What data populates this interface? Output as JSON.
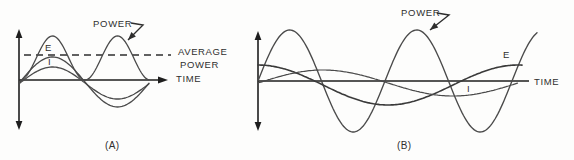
{
  "figure": {
    "colors": {
      "background": "#fdfdfc",
      "axis": "#1e1e1e",
      "curve": "#4a4a4a",
      "curve_dark": "#3a3a3a",
      "dashed": "#2e2e2e",
      "text": "#2f2f2f"
    },
    "panels": [
      {
        "id": "a",
        "caption": "(A)",
        "origin": {
          "x": 20,
          "y": 80
        },
        "vertical_axis": {
          "x": 19,
          "tip_top": 29,
          "tip_bottom": 130,
          "shaft_top": 37,
          "shaft_bottom": 122
        },
        "time_axis": {
          "y": 80,
          "x1": 19,
          "x2": 158,
          "arrow_tip": 168
        },
        "average_line": {
          "y": 55,
          "x1": 24,
          "x2": 171,
          "dash": "7 5"
        },
        "curves": [
          {
            "name": "power-curve",
            "type": "sin2",
            "amplitude": 44,
            "period": 130,
            "offset": 0,
            "t_end": 130,
            "width": 1.3,
            "tone": "curve"
          },
          {
            "name": "voltage-e-curve",
            "type": "sin",
            "amplitude": 25,
            "period": 130,
            "offset": 2,
            "t_end": 130,
            "width": 1.3,
            "tone": "curve"
          },
          {
            "name": "current-i-curve",
            "type": "sin",
            "amplitude": 16,
            "period": 130,
            "offset": 3,
            "t_end": 130,
            "width": 1.3,
            "tone": "curve"
          }
        ],
        "pointer_arrow": {
          "points": [
            [
              131,
              23
            ],
            [
              143,
              25
            ],
            [
              128,
              40
            ]
          ]
        },
        "labels": [
          {
            "name": "power-label",
            "text": "POWER",
            "x": 93,
            "y": 27,
            "size": 9.5,
            "spacing": 0.7
          },
          {
            "name": "e-label",
            "text": "E",
            "x": 45,
            "y": 51,
            "size": 9.5,
            "spacing": 0
          },
          {
            "name": "i-label",
            "text": "I",
            "x": 48,
            "y": 65,
            "size": 9.5,
            "spacing": 0
          },
          {
            "name": "average-power-label-line1",
            "text": "AVERAGE",
            "x": 178,
            "y": 55,
            "size": 9.5,
            "spacing": 0.6
          },
          {
            "name": "average-power-label-line2",
            "text": "POWER",
            "x": 180,
            "y": 68,
            "size": 9.5,
            "spacing": 0.6
          },
          {
            "name": "time-label",
            "text": "TIME",
            "x": 176,
            "y": 82,
            "size": 9.5,
            "spacing": 0.6
          },
          {
            "name": "caption-label",
            "text": "(A)",
            "x": 105,
            "y": 149,
            "size": 10,
            "spacing": 0.4
          }
        ]
      },
      {
        "id": "b",
        "caption": "(B)",
        "origin": {
          "x": 258,
          "y": 81
        },
        "vertical_axis": {
          "x": 258,
          "tip_top": 31,
          "tip_bottom": 131,
          "shaft_top": 39,
          "shaft_bottom": 123
        },
        "time_axis": {
          "y": 81,
          "x1": 258,
          "x2": 529,
          "arrow_tip": null
        },
        "average_line": null,
        "curves": [
          {
            "name": "power-curve",
            "type": "sin",
            "amplitude": 51,
            "period": 127,
            "offset": 0,
            "t_end": 280,
            "width": 1.35,
            "tone": "curve"
          },
          {
            "name": "voltage-e-curve",
            "type": "cos",
            "amplitude": 20,
            "period": 260,
            "offset": 4,
            "t_end": 265,
            "width": 1.6,
            "tone": "curve_dark"
          },
          {
            "name": "current-i-curve",
            "type": "sin",
            "amplitude": 13,
            "period": 260,
            "offset": 2,
            "t_end": 260,
            "width": 1.2,
            "tone": "curve"
          }
        ],
        "pointer_arrow": {
          "points": [
            [
              437,
              13
            ],
            [
              449,
              15
            ],
            [
              430,
              30
            ]
          ]
        },
        "labels": [
          {
            "name": "power-label",
            "text": "POWER",
            "x": 401,
            "y": 16,
            "size": 9.5,
            "spacing": 0.7
          },
          {
            "name": "e-label",
            "text": "E",
            "x": 503,
            "y": 58,
            "size": 9.5,
            "spacing": 0
          },
          {
            "name": "i-label",
            "text": "I",
            "x": 467,
            "y": 92,
            "size": 9.5,
            "spacing": 0
          },
          {
            "name": "time-label",
            "text": "TIME",
            "x": 534,
            "y": 85,
            "size": 9.5,
            "spacing": 0.6
          },
          {
            "name": "caption-label",
            "text": "(B)",
            "x": 397,
            "y": 149,
            "size": 10,
            "spacing": 0.4
          }
        ]
      }
    ]
  }
}
